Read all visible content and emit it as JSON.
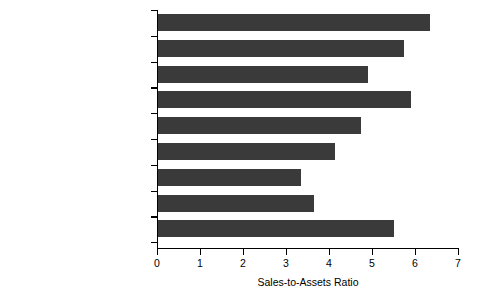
{
  "chart_data": {
    "type": "bar",
    "orientation": "horizontal",
    "title": "",
    "xlabel": "Sales-to-Assets Ratio",
    "ylabel": "",
    "xlim": [
      0,
      7
    ],
    "xticks": [
      0,
      1,
      2,
      3,
      4,
      5,
      6,
      7
    ],
    "xtick_labels": [
      "0",
      "1",
      "2",
      "3",
      "4",
      "5",
      "6",
      "7"
    ],
    "grid": false,
    "legend": null,
    "bar_color": "#3a3a3a",
    "axis_color": "#000000",
    "background_color": "#ffffff",
    "categories": [
      "Professional Services",
      "Business Services",
      "Insurance and Real Estate",
      "Retail",
      "Wholesale",
      "Transportation",
      "Other Manufacturing",
      "Primary Manufacturing",
      "Construction"
    ],
    "values": [
      6.35,
      5.75,
      4.9,
      5.9,
      4.75,
      4.15,
      3.35,
      3.65,
      5.5
    ]
  }
}
